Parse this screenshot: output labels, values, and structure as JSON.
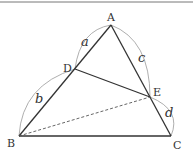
{
  "diagram": {
    "type": "triangle-geometry",
    "points": {
      "A": {
        "label": "A",
        "x": 111,
        "y": 25
      },
      "B": {
        "label": "B",
        "x": 19,
        "y": 136
      },
      "C": {
        "label": "C",
        "x": 171,
        "y": 136
      },
      "D": {
        "label": "D",
        "x": 75,
        "y": 69
      },
      "E": {
        "label": "E",
        "x": 150,
        "y": 97
      }
    },
    "segments": [
      {
        "from": "A",
        "to": "B",
        "style": "solid"
      },
      {
        "from": "A",
        "to": "C",
        "style": "solid"
      },
      {
        "from": "B",
        "to": "C",
        "style": "solid"
      },
      {
        "from": "D",
        "to": "E",
        "style": "solid"
      },
      {
        "from": "B",
        "to": "E",
        "style": "dashed"
      }
    ],
    "lengths": {
      "a": "a",
      "b": "b",
      "c": "c",
      "d": "d"
    },
    "colors": {
      "line": "#333333",
      "arc": "#999999",
      "border": "#777777"
    }
  }
}
